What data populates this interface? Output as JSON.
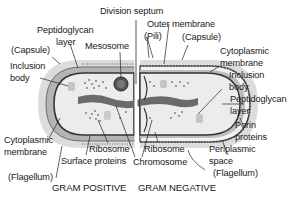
{
  "diagram": {
    "title_left": "GRAM POSITIVE",
    "title_right": "GRAM NEGATIVE",
    "labels": {
      "division_septum": "Division septum",
      "peptidoglycan_left_1": "Peptidoglycan",
      "peptidoglycan_left_2": "layer",
      "mesosome": "Mesosome",
      "capsule_left": "(Capsule)",
      "inclusion_left_1": "Inclusion",
      "inclusion_left_2": "body",
      "cytoplasmic_left_1": "Cytoplasmic",
      "cytoplasmic_left_2": "membrane",
      "flagellum_left": "(Flagellum)",
      "ribosome_left": "Ribosome",
      "surface_proteins": "Surface proteins",
      "chromosome": "Chromosome",
      "ribosome_right": "Ribosome",
      "outer_membrane": "Outer membrane",
      "pili": "(Pili)",
      "capsule_right": "(Capsule)",
      "cytoplasmic_right_1": "Cytoplasmic",
      "cytoplasmic_right_2": "membrane",
      "inclusion_right_1": "Inclusion",
      "inclusion_right_2": "body",
      "peptidoglycan_right_1": "Peptidoglycan",
      "peptidoglycan_right_2": "layer",
      "porin_1": "Porin",
      "porin_2": "proteins",
      "periplasmic_1": "Periplasmic",
      "periplasmic_2": "space",
      "flagellum_right": "(Flagellum)"
    },
    "colors": {
      "capsule": "#d9d9d9",
      "cell_wall": "#a8a8a8",
      "cytoplasm": "#e8e8e8",
      "membrane": "#3a3a3a",
      "chromosome": "#6a6a6a"
    }
  }
}
